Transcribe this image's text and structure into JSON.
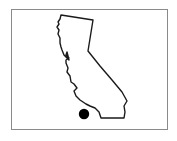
{
  "map": {
    "region": "California",
    "outline_color": "#1a1a1a",
    "frame_color": "#8a8a8a",
    "background_color": "#ffffff",
    "marker": {
      "shape": "dot",
      "color": "#000000",
      "location": "Southern California (Los Angeles area, offshore of coast)"
    }
  }
}
